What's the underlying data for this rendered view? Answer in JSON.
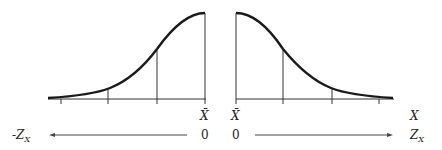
{
  "diagram": {
    "title": "",
    "left_panel": {
      "description": "Left half of normal curve (cumulative from mean)",
      "mean_label": "X̄",
      "zero_label": "0",
      "axis_label": "-Z",
      "axis_label_sub": "X",
      "arrow_direction": "left"
    },
    "right_panel": {
      "description": "Right half of normal curve (from mean)",
      "mean_label": "X̄",
      "zero_label": "0",
      "x_label": "X",
      "axis_label": "Z",
      "axis_label_sub": "X",
      "arrow_direction": "right"
    },
    "colors": {
      "curve": "#1a1a1a",
      "axis": "#333333",
      "background": "#ffffff"
    }
  }
}
